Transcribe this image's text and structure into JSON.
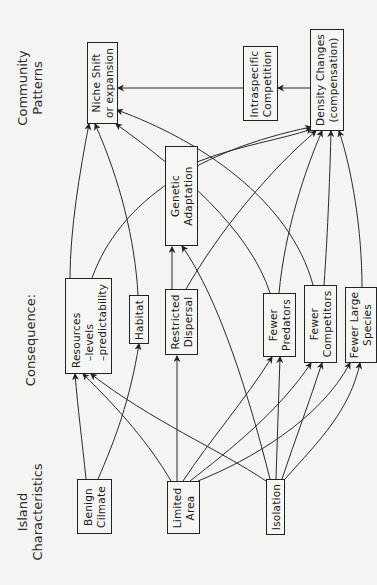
{
  "columns": {
    "community": "Community\nPatterns",
    "consequences": "Consequence:",
    "island": "Island\nCharacteristics"
  },
  "nodes": {
    "niche_shift": "Niche Shift\nor expansion",
    "intraspecific": "Intraspecific\nCompetition",
    "density": "Density Changes\n(compensation)",
    "resources": "Resources\n  –levels\n  –predictability",
    "habitat": "Habitat",
    "restricted_dispersal": "Restricted\nDispersal",
    "genetic_adaptation": "Genetic\nAdaptation",
    "fewer_predators": "Fewer\nPredators",
    "fewer_competitors": "Fewer\nCompetitors",
    "fewer_large_species": "Fewer Large\nSpecies",
    "benign_climate": "Benign\nCilmate",
    "limited_area": "Limited\nArea",
    "isolation": "Isolation"
  },
  "edges": [
    {
      "from": "benign_climate",
      "to": "resources"
    },
    {
      "from": "benign_climate",
      "to": "habitat"
    },
    {
      "from": "limited_area",
      "to": "resources"
    },
    {
      "from": "limited_area",
      "to": "habitat"
    },
    {
      "from": "limited_area",
      "to": "restricted_dispersal"
    },
    {
      "from": "limited_area",
      "to": "fewer_predators"
    },
    {
      "from": "limited_area",
      "to": "fewer_competitors"
    },
    {
      "from": "limited_area",
      "to": "fewer_large_species"
    },
    {
      "from": "isolation",
      "to": "resources"
    },
    {
      "from": "isolation",
      "to": "genetic_adaptation"
    },
    {
      "from": "isolation",
      "to": "fewer_predators"
    },
    {
      "from": "isolation",
      "to": "fewer_competitors"
    },
    {
      "from": "isolation",
      "to": "fewer_large_species"
    },
    {
      "from": "resources",
      "to": "niche_shift"
    },
    {
      "from": "resources",
      "to": "density"
    },
    {
      "from": "habitat",
      "to": "niche_shift"
    },
    {
      "from": "restricted_dispersal",
      "to": "genetic_adaptation"
    },
    {
      "from": "restricted_dispersal",
      "to": "density"
    },
    {
      "from": "genetic_adaptation",
      "to": "density"
    },
    {
      "from": "fewer_predators",
      "to": "niche_shift"
    },
    {
      "from": "fewer_predators",
      "to": "density"
    },
    {
      "from": "fewer_competitors",
      "to": "niche_shift"
    },
    {
      "from": "fewer_competitors",
      "to": "density"
    },
    {
      "from": "fewer_large_species",
      "to": "density"
    },
    {
      "from": "density",
      "to": "intraspecific"
    },
    {
      "from": "intraspecific",
      "to": "niche_shift"
    }
  ]
}
